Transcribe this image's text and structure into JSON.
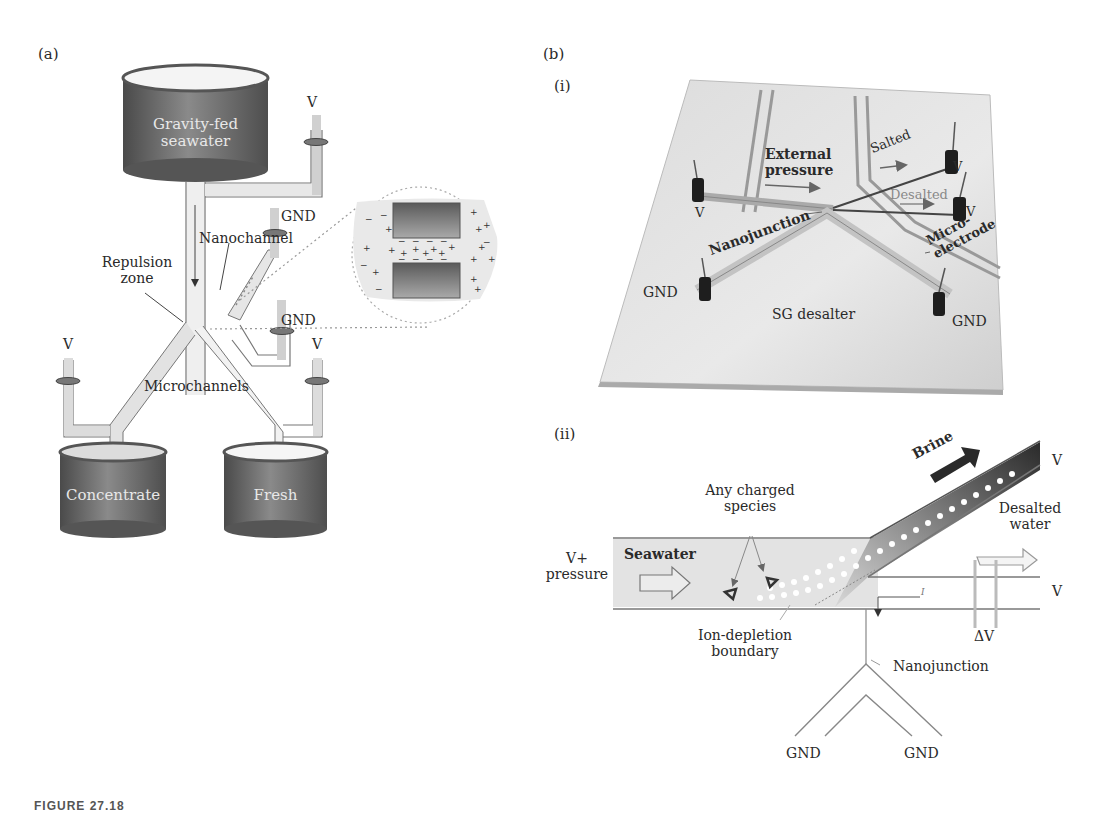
{
  "panel_a": {
    "label": "(a)",
    "tanks": {
      "top": "Gravity-fed\nseawater",
      "top_line1": "Gravity-fed",
      "top_line2": "seawater",
      "bottom_left": "Concentrate",
      "bottom_right": "Fresh"
    },
    "electrodes": {
      "top_right": "V",
      "gnd_upper": "GND",
      "gnd_lower": "GND",
      "left": "V",
      "right": "V"
    },
    "annotations": {
      "nanochannel": "Nanochannel",
      "repulsion_line1": "Repulsion",
      "repulsion_line2": "zone",
      "microchannels": "Microchannels"
    },
    "inset": {
      "description": "magnified nanochannel with positive and negative ions",
      "symbols": [
        "+",
        "-"
      ]
    }
  },
  "panel_b": {
    "label": "(b)",
    "sub_i": {
      "label": "(i)",
      "device_name": "SG desalter",
      "annotations": {
        "external_line1": "External",
        "external_line2": "pressure",
        "salted": "Salted",
        "desalted": "Desalted",
        "nanojunction": "Nanojunction",
        "microelectrode_line1": "Micro-",
        "microelectrode_line2": "electrode"
      },
      "electrodes": {
        "left_v": "V",
        "salted_v": "V",
        "desalted_v": "V",
        "gnd_left": "GND",
        "gnd_right": "GND"
      }
    },
    "sub_ii": {
      "label": "(ii)",
      "annotations": {
        "brine": "Brine",
        "charged_line1": "Any charged",
        "charged_line2": "species",
        "v_pressure_line1": "V+",
        "v_pressure_line2": "pressure",
        "seawater": "Seawater",
        "desalted_line1": "Desalted",
        "desalted_line2": "water",
        "ion_line1": "Ion-depletion",
        "ion_line2": "boundary",
        "nanojunction": "Nanojunction",
        "delta_v": "ΔV",
        "current": "I",
        "v_brine": "V",
        "v_desalted": "V",
        "gnd_left": "GND",
        "gnd_right": "GND"
      }
    }
  },
  "caption": "FIGURE 27.18"
}
